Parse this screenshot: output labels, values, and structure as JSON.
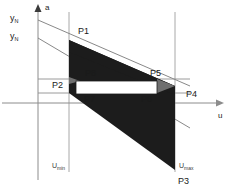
{
  "figure": {
    "axes": {
      "vertical_label": "a",
      "horizontal_label": "u",
      "origin_x": 38,
      "origin_y": 103
    },
    "y_ticks": [
      {
        "name": "y-tick-upper",
        "base": "y",
        "sub": "N",
        "x": 10,
        "y": 18
      },
      {
        "name": "y-tick-lower",
        "base": "y",
        "sub": "N",
        "x": 10,
        "y": 36
      }
    ],
    "bounds": [
      {
        "name": "u-min-line",
        "base": "U",
        "sub": "min",
        "x_line": 69,
        "label_x": 53,
        "label_y": 165
      },
      {
        "name": "u-max-line",
        "base": "U",
        "sub": "max",
        "x_line": 175,
        "label_x": 180,
        "label_y": 165
      }
    ],
    "points": [
      {
        "id": "P1",
        "label_x": 78,
        "label_y": 28
      },
      {
        "id": "P2",
        "label_x": 54,
        "label_y": 82
      },
      {
        "id": "P3",
        "label_x": 180,
        "label_y": 178
      },
      {
        "id": "P4",
        "label_x": 185,
        "label_y": 91
      },
      {
        "id": "P5",
        "label_x": 151,
        "label_y": 70
      },
      {
        "id": "P6",
        "label_x": 142,
        "label_y": 96
      },
      {
        "id": "P7",
        "label_x": 85,
        "label_y": 96
      },
      {
        "id": "P8",
        "label_x": 86,
        "label_y": 70
      }
    ],
    "shape": {
      "fill": "#1c1c1c",
      "hole_fill": "#ffffff",
      "outer_polygon": "69,40 175,75 175,103 175,168 69,103",
      "inner_rect": {
        "x": 76,
        "y": 81,
        "width": 81,
        "height": 13
      },
      "gray_shade": "#6f6f6f"
    },
    "guides": {
      "axis_color": "#8c8c8c",
      "guide_color": "#9a9a9a",
      "ray_color": "#7a7a7a"
    }
  }
}
